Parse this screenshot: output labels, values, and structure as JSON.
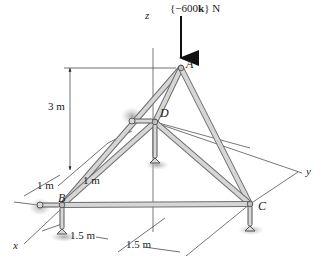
{
  "figure": {
    "type": "space-truss",
    "load": {
      "label_prefix": "{",
      "label_value": "−600",
      "label_unit_vector": "k",
      "label_suffix": "} N",
      "point": "A"
    },
    "points": [
      {
        "id": "A",
        "label": "A"
      },
      {
        "id": "B",
        "label": "B"
      },
      {
        "id": "C",
        "label": "C"
      },
      {
        "id": "D",
        "label": "D"
      }
    ],
    "axes": {
      "x": "x",
      "y": "y",
      "z": "z"
    },
    "dimensions": [
      {
        "id": "height",
        "label": "3 m"
      },
      {
        "id": "d_offset",
        "label": "1 m"
      },
      {
        "id": "b_offset",
        "label": "1 m"
      },
      {
        "id": "bc_half_1",
        "label": "1.5 m"
      },
      {
        "id": "bc_half_2",
        "label": "1.5 m"
      }
    ],
    "members": [
      "AB",
      "AC",
      "AD",
      "BD",
      "CD",
      "BC"
    ],
    "colors": {
      "member_fill": "#d2d2d2",
      "member_edge": "#6e6e6e",
      "line": "#333333",
      "support_shadow": "#bdbdbd"
    }
  }
}
